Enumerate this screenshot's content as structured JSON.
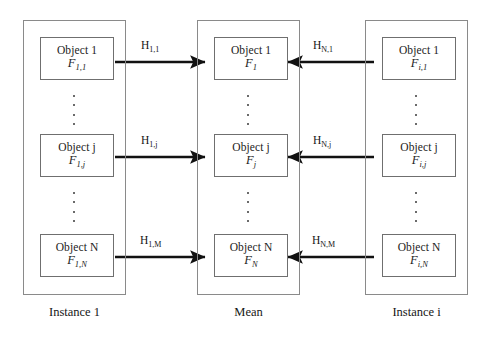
{
  "diagram": {
    "colors": {
      "frame_border": "#8a8a8a",
      "box_border": "#6f6f6f",
      "arrow": "#111111",
      "text": "#1a1a1a",
      "background": "#ffffff"
    },
    "columns": [
      {
        "id": "instance-1",
        "caption": "Instance 1",
        "objects": [
          {
            "title": "Object 1",
            "feature_base": "F",
            "feature_sub": "1,1"
          },
          {
            "title": "Object j",
            "feature_base": "F",
            "feature_sub": "1,j"
          },
          {
            "title": "Object N",
            "feature_base": "F",
            "feature_sub": "1,N"
          }
        ]
      },
      {
        "id": "mean",
        "caption": "Mean",
        "objects": [
          {
            "title": "Object 1",
            "feature_base": "F",
            "feature_sub": "1"
          },
          {
            "title": "Object j",
            "feature_base": "F",
            "feature_sub": "j"
          },
          {
            "title": "Object N",
            "feature_base": "F",
            "feature_sub": "N"
          }
        ]
      },
      {
        "id": "instance-i",
        "caption": "Instance i",
        "objects": [
          {
            "title": "Object 1",
            "feature_base": "F",
            "feature_sub": "i,1"
          },
          {
            "title": "Object j",
            "feature_base": "F",
            "feature_sub": "i,j"
          },
          {
            "title": "Object N",
            "feature_base": "F",
            "feature_sub": "i,N"
          }
        ]
      }
    ],
    "arrows": {
      "left_to_mean": [
        {
          "base": "H",
          "sub": "1,1",
          "direction": "right"
        },
        {
          "base": "H",
          "sub": "1,j",
          "direction": "right"
        },
        {
          "base": "H",
          "sub": "1,M",
          "direction": "right"
        }
      ],
      "right_to_mean": [
        {
          "base": "H",
          "sub": "N,1",
          "direction": "left"
        },
        {
          "base": "H",
          "sub": "N,j",
          "direction": "left"
        },
        {
          "base": "H",
          "sub": "N,M",
          "direction": "left"
        }
      ]
    },
    "ellipsis": {
      "dot_count": 4,
      "positions": [
        "between-row1-row2",
        "between-row2-row3"
      ]
    }
  }
}
